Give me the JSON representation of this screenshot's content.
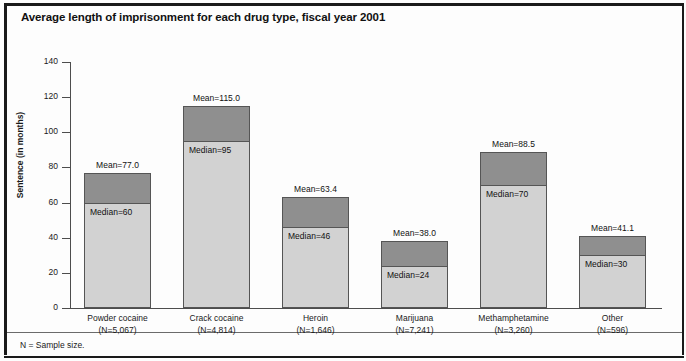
{
  "figure": {
    "title": "Average length of imprisonment for each drug type, fiscal year 2001",
    "footnote": "N = Sample size.",
    "ylabel": "Sentence (in months)"
  },
  "colors": {
    "mean_segment": "#8f8f8f",
    "median_segment": "#d2d2d2",
    "bar_outline": "#555555",
    "axis": "#4d4d4d",
    "frame": "#1a1a1a",
    "background": "#fdfdfd",
    "text": "#111111"
  },
  "chart_data": {
    "type": "bar",
    "title": "Average length of imprisonment for each drug type, fiscal year 2001",
    "subtitle": "",
    "xlabel": "",
    "ylabel": "Sentence (in months)",
    "ylim": [
      0,
      140
    ],
    "yticks": [
      0,
      20,
      40,
      60,
      80,
      100,
      120,
      140
    ],
    "ytick_labels": [
      "0",
      "20",
      "40",
      "60",
      "80",
      "100",
      "120",
      "140"
    ],
    "grid": false,
    "legend": null,
    "note": "Each bar is stacked: the lower light-gray segment reaches the median and the full bar height reaches the mean.",
    "categories": [
      "Powder cocaine",
      "Crack cocaine",
      "Heroin",
      "Marijuana",
      "Methamphetamine",
      "Other"
    ],
    "series": [
      {
        "name": "Median",
        "values": [
          60,
          95,
          46,
          24,
          70,
          30
        ]
      },
      {
        "name": "Mean",
        "values": [
          77.0,
          115.0,
          63.4,
          38.0,
          88.5,
          41.1
        ]
      }
    ],
    "sample_sizes": [
      5067,
      4814,
      1646,
      7241,
      3260,
      596
    ]
  },
  "bars": [
    {
      "category": "Powder cocaine",
      "n_label": "(N=5,067)",
      "mean": 77.0,
      "median": 60,
      "mean_label": "Mean=77.0",
      "median_label": "Median=60"
    },
    {
      "category": "Crack cocaine",
      "n_label": "(N=4,814)",
      "mean": 115.0,
      "median": 95,
      "mean_label": "Mean=115.0",
      "median_label": "Median=95"
    },
    {
      "category": "Heroin",
      "n_label": "(N=1,646)",
      "mean": 63.4,
      "median": 46,
      "mean_label": "Mean=63.4",
      "median_label": "Median=46"
    },
    {
      "category": "Marijuana",
      "n_label": "(N=7,241)",
      "mean": 38.0,
      "median": 24,
      "mean_label": "Mean=38.0",
      "median_label": "Median=24"
    },
    {
      "category": "Methamphetamine",
      "n_label": "(N=3,260)",
      "mean": 88.5,
      "median": 70,
      "mean_label": "Mean=88.5",
      "median_label": "Median=70"
    },
    {
      "category": "Other",
      "n_label": "(N=596)",
      "mean": 41.1,
      "median": 30,
      "mean_label": "Mean=41.1",
      "median_label": "Median=30"
    }
  ]
}
